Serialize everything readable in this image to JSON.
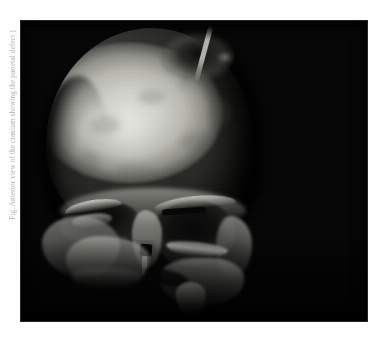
{
  "page": {
    "background_color": "#fefefe"
  },
  "margin_caption": {
    "text": "Fig. Anterior view of the cranium showing the parietal defect )",
    "orientation": "rotated-90-ccw",
    "color": "#8e8e8e"
  },
  "figure": {
    "name": "skull-photograph",
    "kind": "grayscale-photograph",
    "background_color": "#050505",
    "panel": {
      "x": 20,
      "y": 20,
      "width": 348,
      "height": 302
    },
    "tones": {
      "bone_highlight": "#dcdcd7",
      "bone_midtone": "#b9b9b2",
      "bone_shadow": "#5a5a55",
      "cavity_black": "#060606",
      "background_black": "#050505"
    },
    "features": [
      {
        "name": "cranium",
        "label": "Cranial vault (frontal / parietal bones)"
      },
      {
        "name": "parietal-lesion",
        "label": "Dark lesion / bone defect, right parietal"
      },
      {
        "name": "lesion-splinter",
        "label": "Bright bone splinter at lesion margin"
      },
      {
        "name": "brow-ridge",
        "label": "Supraorbital shelf"
      },
      {
        "name": "orbit-left",
        "label": "Orbit (viewer left), eroded superior margin"
      },
      {
        "name": "orbit-right",
        "label": "Orbit (viewer right), intact and rounded"
      },
      {
        "name": "nasal-aperture",
        "label": "Nasal aperture opening"
      },
      {
        "name": "nasal-septum",
        "label": "Nasal septum remnant"
      },
      {
        "name": "zygomatic-right",
        "label": "Zygomatic / lateral orbital wall"
      },
      {
        "name": "maxilla-left",
        "label": "Left maxilla, fractured inferior margin"
      },
      {
        "name": "maxilla-right",
        "label": "Right maxilla with alveolar fragment"
      }
    ]
  }
}
